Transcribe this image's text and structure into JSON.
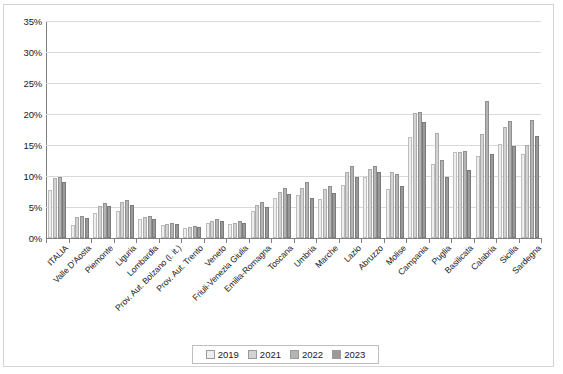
{
  "chart_data": {
    "type": "bar",
    "title": "",
    "subtitle": "",
    "xlabel": "",
    "ylabel": "",
    "ylim": [
      0,
      35
    ],
    "ytick_labels": [
      "0%",
      "5%",
      "10%",
      "15%",
      "20%",
      "25%",
      "30%",
      "35%"
    ],
    "ytick_values": [
      0,
      5,
      10,
      15,
      20,
      25,
      30,
      35
    ],
    "grid": true,
    "legend_position": "bottom",
    "categories": [
      "ITALIA",
      "Valle D'Aosta",
      "Piemonte",
      "Liguria",
      "Lombardia",
      "Prov. Aut. Bolzano (l. it.)",
      "Prov. Aut. Trento",
      "Veneto",
      "Friuli-Venezia Giulia",
      "Emilia-Romagna",
      "Toscana",
      "Umbria",
      "Marche",
      "Lazio",
      "Abruzzo",
      "Molise",
      "Campania",
      "Puglia",
      "Basilicata",
      "Calabria",
      "Sicilia",
      "Sardegna"
    ],
    "series": [
      {
        "name": "2019",
        "color": "#eeeeee",
        "values": [
          7.8,
          2.1,
          4.0,
          4.4,
          3.1,
          2.1,
          1.6,
          2.4,
          2.3,
          4.4,
          6.4,
          7.0,
          6.3,
          8.5,
          9.9,
          7.9,
          16.3,
          11.9,
          13.8,
          13.2,
          15.1,
          13.5
        ]
      },
      {
        "name": "2021",
        "color": "#d3d3d3",
        "values": [
          9.7,
          3.4,
          5.2,
          5.8,
          3.4,
          2.3,
          1.8,
          2.8,
          2.5,
          5.3,
          7.5,
          8.0,
          7.9,
          10.6,
          11.2,
          10.6,
          20.2,
          16.9,
          13.9,
          16.8,
          17.9,
          15.0
        ]
      },
      {
        "name": "2022",
        "color": "#b4b4b4",
        "values": [
          9.8,
          3.6,
          5.6,
          6.1,
          3.6,
          2.4,
          1.9,
          3.0,
          2.7,
          5.8,
          8.0,
          9.0,
          8.4,
          11.6,
          11.6,
          10.3,
          20.3,
          12.6,
          14.0,
          22.1,
          18.8,
          19.0
        ]
      },
      {
        "name": "2023",
        "color": "#9a9a9a",
        "values": [
          9.1,
          3.3,
          5.2,
          5.3,
          3.1,
          2.2,
          1.8,
          2.7,
          2.5,
          5.0,
          7.1,
          6.4,
          7.2,
          9.9,
          10.6,
          8.4,
          18.7,
          9.9,
          11.0,
          13.6,
          14.8,
          16.4
        ]
      }
    ]
  },
  "legend": {
    "entries": [
      {
        "label": "2019",
        "swatch": "#eeeeee"
      },
      {
        "label": "2021",
        "swatch": "#d3d3d3"
      },
      {
        "label": "2022",
        "swatch": "#b4b4b4"
      },
      {
        "label": "2023",
        "swatch": "#9a9a9a"
      }
    ]
  }
}
